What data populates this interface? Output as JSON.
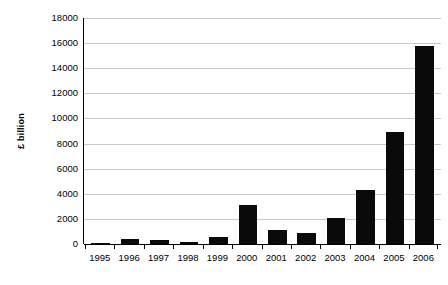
{
  "chart_data": {
    "type": "bar",
    "title": "",
    "subtitle": "",
    "xlabel": "",
    "ylabel": "£ billion",
    "categories": [
      "1995",
      "1996",
      "1997",
      "1998",
      "1999",
      "2000",
      "2001",
      "2002",
      "2003",
      "2004",
      "2005",
      "2006"
    ],
    "values": [
      100,
      400,
      300,
      200,
      550,
      3100,
      1100,
      850,
      2050,
      4300,
      8950,
      15800
    ],
    "series": [
      {
        "name": "",
        "values": [
          100,
          400,
          300,
          200,
          550,
          3100,
          1100,
          850,
          2050,
          4300,
          8950,
          15800
        ]
      }
    ],
    "ylim": [
      0,
      18000
    ],
    "y_ticks": [
      0,
      2000,
      4000,
      6000,
      8000,
      10000,
      12000,
      14000,
      16000,
      18000
    ],
    "y_tick_labels": [
      "0",
      "2000",
      "4000",
      "6000",
      "8000",
      "10000",
      "12000",
      "14000",
      "16000",
      "18000"
    ],
    "grid": true,
    "grid_axis": "y",
    "legend": false,
    "legend_position": "none",
    "bar_color": "#0a0a0a",
    "gridline_color": "#c9c9c9",
    "axis_color": "#000000",
    "background_color": "#ffffff"
  }
}
